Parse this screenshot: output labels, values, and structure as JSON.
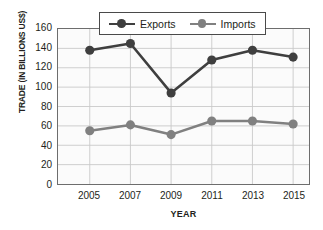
{
  "chart_data": {
    "type": "line",
    "title": "",
    "xlabel": "YEAR",
    "ylabel": "TRADE (IN BILLIONS US$)",
    "categories": [
      "2005",
      "2007",
      "2009",
      "2011",
      "2013",
      "2015"
    ],
    "series": [
      {
        "name": "Exports",
        "color": "#3f3f3f",
        "values": [
          138,
          145,
          94,
          128,
          138,
          131
        ]
      },
      {
        "name": "Imports",
        "color": "#808080",
        "values": [
          55,
          61,
          51,
          65,
          65,
          62
        ]
      }
    ],
    "ylim": [
      0,
      160
    ],
    "ytick_step": 20,
    "yticks": [
      "160",
      "140",
      "120",
      "100",
      "80",
      "60",
      "40",
      "20",
      "0"
    ],
    "grid": true,
    "legend_position": "top-center"
  },
  "legend": {
    "entries": [
      {
        "label": "Exports",
        "marker": "circle-dark"
      },
      {
        "label": "Imports",
        "marker": "circle-gray"
      }
    ]
  },
  "axes": {
    "y_title": "TRADE (IN BILLIONS US$)",
    "x_title": "YEAR"
  },
  "colors": {
    "exports": "#3f3f3f",
    "imports": "#808080",
    "panel_border": "#6d6d6d",
    "gridline": "#c9c9c9",
    "panel_fill": "#fbfbfb",
    "text": "#231f20"
  }
}
